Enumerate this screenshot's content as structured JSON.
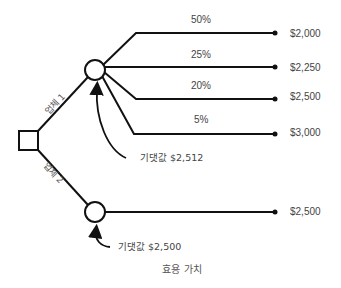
{
  "diagram": {
    "type": "decision-tree",
    "decision_node": {
      "shape": "square"
    },
    "branches": [
      {
        "label": "업체 1",
        "chance_node": {
          "shape": "circle"
        },
        "expected_value_label": "기댓값 $2,512",
        "outcomes": [
          {
            "probability": "50%",
            "value": "$2,000"
          },
          {
            "probability": "25%",
            "value": "$2,250"
          },
          {
            "probability": "20%",
            "value": "$2,500"
          },
          {
            "probability": "5%",
            "value": "$3,000"
          }
        ]
      },
      {
        "label": "업체 2",
        "chance_node": {
          "shape": "circle"
        },
        "expected_value_label": "기댓값 $2,500",
        "outcomes": [
          {
            "probability": "",
            "value": "$2,500"
          }
        ]
      }
    ],
    "caption": "효용 가치",
    "colors": {
      "line": "#111111",
      "text": "#444444"
    }
  }
}
